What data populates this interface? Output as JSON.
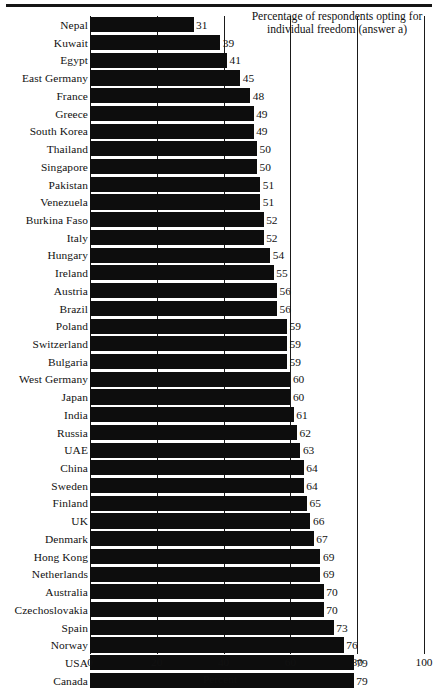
{
  "chart_data": {
    "type": "bar",
    "orientation": "horizontal",
    "title": "Percentage of respondents opting for individual freedom (answer a)",
    "title_line1": "Percentage of respondents opting for",
    "title_line2": "individual freedom (answer a)",
    "xlabel": "Percent",
    "ylabel": "",
    "xlim": [
      0,
      100
    ],
    "xticks": [
      0,
      20,
      40,
      60,
      80,
      100
    ],
    "xtick_labels": [
      "0",
      "20",
      "40",
      "60",
      "80",
      "100"
    ],
    "grid": "vertical",
    "legend": "none",
    "bar_color": "#0d0d0d",
    "categories": [
      "Nepal",
      "Kuwait",
      "Egypt",
      "East Germany",
      "France",
      "Greece",
      "South Korea",
      "Thailand",
      "Singapore",
      "Pakistan",
      "Venezuela",
      "Burkina Faso",
      "Italy",
      "Hungary",
      "Ireland",
      "Austria",
      "Brazil",
      "Poland",
      "Switzerland",
      "Bulgaria",
      "West Germany",
      "Japan",
      "India",
      "Russia",
      "UAE",
      "China",
      "Sweden",
      "Finland",
      "UK",
      "Denmark",
      "Hong Kong",
      "Netherlands",
      "Australia",
      "Czechoslovakia",
      "Spain",
      "Norway",
      "USA",
      "Canada"
    ],
    "values": [
      31,
      39,
      41,
      45,
      48,
      49,
      49,
      50,
      50,
      51,
      51,
      52,
      52,
      54,
      55,
      56,
      56,
      59,
      59,
      59,
      60,
      60,
      61,
      62,
      63,
      64,
      64,
      65,
      66,
      67,
      69,
      69,
      70,
      70,
      73,
      76,
      79,
      79
    ],
    "value_labels": [
      "31",
      "39",
      "41",
      "45",
      "48",
      "49",
      "49",
      "50",
      "50",
      "51",
      "51",
      "52",
      "52",
      "54",
      "55",
      "56",
      "56",
      "59",
      "59",
      "59",
      "60",
      "60",
      "61",
      "62",
      "63",
      "64",
      "64",
      "65",
      "66",
      "67",
      "69",
      "69",
      "70",
      "70",
      "73",
      "76",
      "79",
      "79"
    ]
  }
}
